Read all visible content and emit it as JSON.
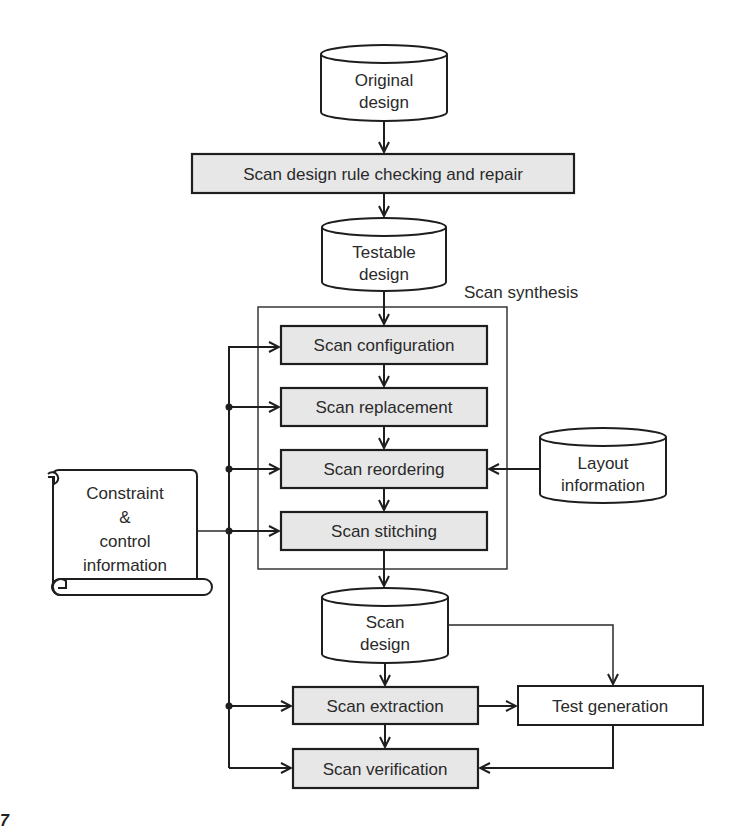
{
  "diagram": {
    "nodes": {
      "original_design": {
        "line1": "Original",
        "line2": "design",
        "shape": "cylinder"
      },
      "rule_check": {
        "label": "Scan design rule checking and repair",
        "shape": "process"
      },
      "testable_design": {
        "line1": "Testable",
        "line2": "design",
        "shape": "cylinder"
      },
      "synthesis_group": {
        "label": "Scan synthesis",
        "shape": "group"
      },
      "scan_configuration": {
        "label": "Scan configuration",
        "shape": "process"
      },
      "scan_replacement": {
        "label": "Scan replacement",
        "shape": "process"
      },
      "scan_reordering": {
        "label": "Scan reordering",
        "shape": "process"
      },
      "scan_stitching": {
        "label": "Scan stitching",
        "shape": "process"
      },
      "layout_information": {
        "line1": "Layout",
        "line2": "information",
        "shape": "cylinder"
      },
      "constraint_info": {
        "line1": "Constraint",
        "line2": "&",
        "line3": "control",
        "line4": "information",
        "shape": "scroll"
      },
      "scan_design": {
        "line1": "Scan",
        "line2": "design",
        "shape": "cylinder"
      },
      "scan_extraction": {
        "label": "Scan extraction",
        "shape": "process"
      },
      "test_generation": {
        "label": "Test generation",
        "shape": "plain-box"
      },
      "scan_verification": {
        "label": "Scan verification",
        "shape": "process"
      }
    },
    "edges": [
      [
        "Original design",
        "Scan design rule checking and repair"
      ],
      [
        "Scan design rule checking and repair",
        "Testable design"
      ],
      [
        "Testable design",
        "Scan configuration"
      ],
      [
        "Scan configuration",
        "Scan replacement"
      ],
      [
        "Scan replacement",
        "Scan reordering"
      ],
      [
        "Scan reordering",
        "Scan stitching"
      ],
      [
        "Layout information",
        "Scan reordering"
      ],
      [
        "Scan stitching",
        "Scan design"
      ],
      [
        "Scan design",
        "Scan extraction"
      ],
      [
        "Scan design",
        "Test generation"
      ],
      [
        "Scan extraction",
        "Test generation"
      ],
      [
        "Scan extraction",
        "Scan verification"
      ],
      [
        "Test generation",
        "Scan verification"
      ],
      [
        "Constraint & control information",
        "Scan configuration"
      ],
      [
        "Constraint & control information",
        "Scan replacement"
      ],
      [
        "Constraint & control information",
        "Scan reordering"
      ],
      [
        "Constraint & control information",
        "Scan stitching"
      ],
      [
        "Constraint & control information",
        "Scan extraction"
      ],
      [
        "Constraint & control information",
        "Scan verification"
      ]
    ],
    "colors": {
      "process_fill": "#e7e7e7",
      "stroke": "#1e1e1e",
      "background": "#ffffff"
    }
  },
  "figure_mark": "7"
}
